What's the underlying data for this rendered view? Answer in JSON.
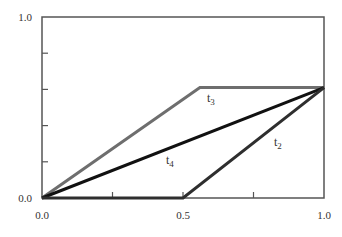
{
  "chart_data": {
    "type": "line",
    "title": "",
    "xlabel": "",
    "ylabel": "",
    "xlim": [
      0.0,
      1.0
    ],
    "ylim": [
      0.0,
      1.0
    ],
    "grid": false,
    "legend": "inline labels",
    "x_tick_labels": [
      "0.0",
      "0.5",
      "1.0"
    ],
    "x_tick_positions": [
      0.0,
      0.25,
      0.5,
      0.75,
      1.0
    ],
    "y_tick_labels": [
      "0.0",
      "1.0"
    ],
    "y_tick_positions": [
      0.0,
      0.2,
      0.4,
      0.6,
      0.8,
      1.0
    ],
    "series": [
      {
        "name": "t3",
        "label_main": "t",
        "label_sub": "3",
        "color": "#6e6e6e",
        "x": [
          0.0,
          0.56,
          1.0
        ],
        "y": [
          0.0,
          0.61,
          0.61
        ]
      },
      {
        "name": "t4",
        "label_main": "t",
        "label_sub": "4",
        "color": "#111111",
        "x": [
          0.0,
          1.0
        ],
        "y": [
          0.0,
          0.61
        ]
      },
      {
        "name": "t2",
        "label_main": "t",
        "label_sub": "2",
        "color": "#2e2e2e",
        "x": [
          0.0,
          0.5,
          1.0
        ],
        "y": [
          0.0,
          0.0,
          0.61
        ]
      }
    ]
  }
}
